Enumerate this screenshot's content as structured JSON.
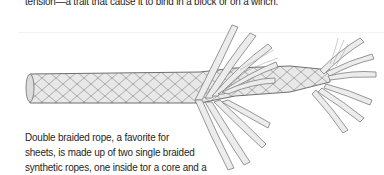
{
  "page": {
    "top_text": "tension—a trait that cause it to bind in a block or on a winch.",
    "caption_lines": [
      "Double braided rope, a favorite for",
      "sheets, is made up of two single braided",
      "synthetic ropes, one inside tor a core and a"
    ]
  },
  "figure": {
    "colors": {
      "strand_fill": "#e6e6e6",
      "strand_outline": "#8a8a8a",
      "background": "#ffffff"
    }
  }
}
